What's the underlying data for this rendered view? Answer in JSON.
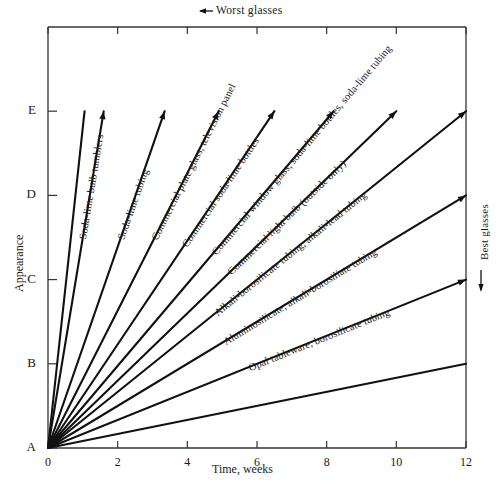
{
  "chart_data": {
    "type": "line",
    "title": "",
    "xlabel": "Time, weeks",
    "ylabel": "Appearance",
    "xlim": [
      0,
      12
    ],
    "ylim": [
      0,
      5
    ],
    "grid": false,
    "legend_position": "inline-labels",
    "x_ticks": [
      "0",
      "2",
      "4",
      "6",
      "8",
      "10",
      "12"
    ],
    "x_tick_values": [
      0,
      2,
      4,
      6,
      8,
      10,
      12
    ],
    "y_ticks": [
      "A",
      "B",
      "C",
      "D",
      "E"
    ],
    "y_tick_values": [
      0,
      1,
      2,
      3,
      4
    ],
    "annotations": [
      {
        "name": "worst-glasses",
        "text": "Worst  glasses",
        "arrow": "left",
        "position": "top"
      },
      {
        "name": "best-glasses",
        "text": "Best glasses",
        "arrow": "down",
        "position": "right"
      }
    ],
    "series": [
      {
        "name": "Soda-lime bulb tumblers",
        "label": "Soda-lime bulb tumblers",
        "x": [
          0,
          1.6
        ],
        "y": [
          0,
          4
        ],
        "end_x": 1.6,
        "end_y": 4
      },
      {
        "name": "Soda-lime tubing",
        "label": "Soda-lime tubing",
        "x": [
          0,
          3.35
        ],
        "y": [
          0,
          4
        ],
        "end_x": 3.35,
        "end_y": 4
      },
      {
        "name": "Commercial plate glass, television panel",
        "label": "Commercial plate glass, television panel",
        "x": [
          0,
          4.9
        ],
        "y": [
          0,
          4
        ],
        "end_x": 4.9,
        "end_y": 4
      },
      {
        "name": "Commercial soda-lime bottles",
        "label": "Commercial soda-lime bottles",
        "x": [
          0,
          6.5
        ],
        "y": [
          0,
          4
        ],
        "end_x": 6.5,
        "end_y": 4
      },
      {
        "name": "Commercial window glass, soda-lime bottles, soda-lime tubing",
        "label": "Commercial window glass, soda-lime bottles, soda-lime tubing",
        "x": [
          0,
          8.2
        ],
        "y": [
          0,
          4
        ],
        "end_x": 8.2,
        "end_y": 4
      },
      {
        "name": "Commercial light bulb (outside only)",
        "label": "Commercial light bulb (outside only)",
        "x": [
          0,
          10.0
        ],
        "y": [
          0,
          4
        ],
        "end_x": 10.0,
        "end_y": 4
      },
      {
        "name": "Alkali-borosilicate tubing, alkali-lead tubing",
        "label": "Alkali-borosilicate tubing, alkali-lead tubing",
        "x": [
          0,
          12
        ],
        "y": [
          0,
          4
        ],
        "end_x": 12,
        "end_y": 4
      },
      {
        "name": "Aluminosilicate, alkali-borosiliate tubing",
        "label": "Aluminosilicate, alkali-borosiliate tubing",
        "x": [
          0,
          12
        ],
        "y": [
          0,
          3
        ],
        "end_x": 12,
        "end_y": 3
      },
      {
        "name": "Opal tableware, borosilicate tubing",
        "label": "Opal tableware, borosilicate tubing",
        "x": [
          0,
          12
        ],
        "y": [
          0,
          2
        ],
        "end_x": 12,
        "end_y": 2
      },
      {
        "name": "unlabeled-steep-1",
        "label": "",
        "x": [
          0,
          1.05
        ],
        "y": [
          0,
          4
        ],
        "end_x": 1.05,
        "end_y": 4
      },
      {
        "name": "unlabeled-mid-1",
        "label": "",
        "x": [
          0,
          12
        ],
        "y": [
          0,
          1.0
        ],
        "end_x": 12,
        "end_y": 1.0
      }
    ],
    "colors": {
      "line": "#111111",
      "axis": "#333333",
      "background": "#ffffff",
      "text": "#1a1a1a"
    }
  }
}
